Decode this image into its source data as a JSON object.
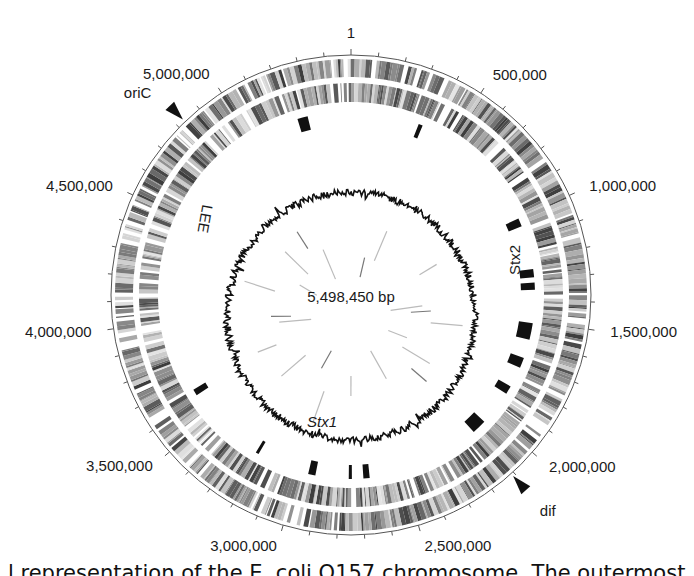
{
  "figure": {
    "genome_size_bp": 5498450,
    "center_label": "5,498,450 bp",
    "position_labels": [
      {
        "bp": 1,
        "text": "1"
      },
      {
        "bp": 500000,
        "text": "500,000"
      },
      {
        "bp": 1000000,
        "text": "1,000,000"
      },
      {
        "bp": 1500000,
        "text": "1,500,000"
      },
      {
        "bp": 2000000,
        "text": "2,000,000"
      },
      {
        "bp": 2500000,
        "text": "2,500,000"
      },
      {
        "bp": 3000000,
        "text": "3,000,000"
      },
      {
        "bp": 3500000,
        "text": "3,500,000"
      },
      {
        "bp": 4000000,
        "text": "4,000,000"
      },
      {
        "bp": 4500000,
        "text": "4,500,000"
      },
      {
        "bp": 5000000,
        "text": "5,000,000"
      }
    ],
    "markers": [
      {
        "name": "oriC",
        "text": "oriC",
        "bp": 4830000
      },
      {
        "name": "dif",
        "text": "dif",
        "bp": 2110000
      }
    ],
    "feature_labels": [
      {
        "name": "lee",
        "text": "LEE",
        "bp": 4640000
      },
      {
        "name": "stx2",
        "text": "Stx2",
        "bp": 1290000
      },
      {
        "name": "stx1",
        "text": "Stx1",
        "bp": 2920000
      }
    ],
    "islands": [
      {
        "bp_start": 5240000,
        "bp_end": 5290000
      },
      {
        "bp_start": 330000,
        "bp_end": 350000
      },
      {
        "bp_start": 1000000,
        "bp_end": 1040000
      },
      {
        "bp_start": 1250000,
        "bp_end": 1290000
      },
      {
        "bp_start": 1315000,
        "bp_end": 1350000
      },
      {
        "bp_start": 1510000,
        "bp_end": 1590000
      },
      {
        "bp_start": 1680000,
        "bp_end": 1730000
      },
      {
        "bp_start": 1830000,
        "bp_end": 1870000
      },
      {
        "bp_start": 2040000,
        "bp_end": 2110000
      },
      {
        "bp_start": 2660000,
        "bp_end": 2690000
      },
      {
        "bp_start": 2745000,
        "bp_end": 2760000
      },
      {
        "bp_start": 2920000,
        "bp_end": 2955000
      },
      {
        "bp_start": 3210000,
        "bp_end": 3225000
      },
      {
        "bp_start": 3620000,
        "bp_end": 3650000
      }
    ],
    "inner_rays_bp": [
      200000,
      350000,
      900000,
      1250000,
      1320000,
      1450000,
      1700000,
      1850000,
      2000000,
      2300000,
      2750000,
      3050000,
      3200000,
      3500000,
      3800000,
      4050000,
      4120000,
      4400000,
      4600000,
      4800000,
      5000000,
      5150000
    ],
    "caption": "l representation of the E. coli O157 chromosome. The outermost"
  },
  "colors": {
    "band_dark": "#3a3a3a",
    "band_light": "#d8d8d8",
    "island": "#111111",
    "gc_line": "#111111",
    "axis": "#555555"
  }
}
